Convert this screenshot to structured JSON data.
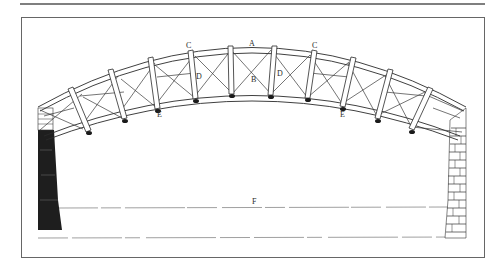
{
  "figure": {
    "title": "",
    "type": "engraving",
    "labels": [
      {
        "id": "A",
        "text": "A",
        "x": 252,
        "y": 46
      },
      {
        "id": "C-left",
        "text": "C",
        "x": 188,
        "y": 48
      },
      {
        "id": "C-right",
        "text": "C",
        "x": 314,
        "y": 48
      },
      {
        "id": "D-left",
        "text": "D",
        "x": 198,
        "y": 79
      },
      {
        "id": "D-right",
        "text": "D",
        "x": 279,
        "y": 76
      },
      {
        "id": "B",
        "text": "B",
        "x": 253,
        "y": 82
      },
      {
        "id": "E-left",
        "text": "E",
        "x": 159,
        "y": 116
      },
      {
        "id": "E-right",
        "text": "E",
        "x": 342,
        "y": 116
      },
      {
        "id": "F",
        "text": "F",
        "x": 254,
        "y": 204
      }
    ],
    "colors": {
      "ink": "#2a2a2a",
      "rule": "#555555",
      "paper": "#ffffff",
      "abutment_dark": "#1e1e1e"
    }
  }
}
